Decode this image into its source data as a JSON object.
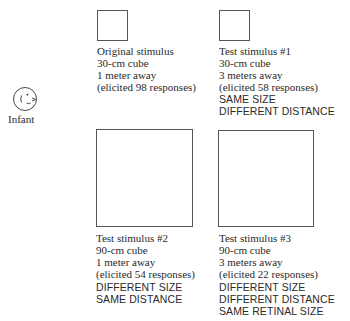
{
  "subject": {
    "icon": "infant-face-icon",
    "label": "Infant"
  },
  "stimuli": [
    {
      "title": "Original stimulus",
      "size": "30-cm cube",
      "distance": "1 meter away",
      "responses": "(elicited 98 responses)",
      "notes": []
    },
    {
      "title": "Test stimulus #1",
      "size": "30-cm cube",
      "distance": "3 meters away",
      "responses": "(elicited 58 responses)",
      "notes": [
        "SAME SIZE",
        "DIFFERENT DISTANCE"
      ]
    },
    {
      "title": "Test stimulus #2",
      "size": "90-cm cube",
      "distance": "1 meter away",
      "responses": "(elicited 54 responses)",
      "notes": [
        "DIFFERENT SIZE",
        "SAME DISTANCE"
      ]
    },
    {
      "title": "Test stimulus #3",
      "size": "90-cm cube",
      "distance": "3 meters away",
      "responses": "(elicited 22 responses)",
      "notes": [
        "DIFFERENT SIZE",
        "DIFFERENT DISTANCE",
        "SAME RETINAL SIZE"
      ]
    }
  ]
}
